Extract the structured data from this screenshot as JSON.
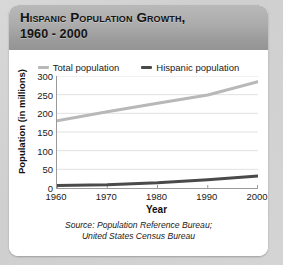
{
  "card": {
    "title_main": "Hispanic Population Growth,",
    "title_sub": "1960 - 2000"
  },
  "source": {
    "line1": "Source: Population Reference Bureau;",
    "line2": "United States Census Bureau"
  },
  "colors": {
    "total_line": "#b8b8b8",
    "hispanic_line": "#4a4a4a",
    "axis": "#9a9a9a",
    "grid": "#e2e2e2",
    "card_bg": "#ffffff",
    "page_bg": "#d4d4d4",
    "titlebar_top": "#b9b9b9",
    "titlebar_bottom": "#949494",
    "text": "#111111"
  },
  "chart_data": {
    "type": "line",
    "title": "Hispanic Population Growth, 1960 - 2000",
    "xlabel": "Year",
    "ylabel": "Population (in millions)",
    "x": [
      1960,
      1970,
      1980,
      1990,
      2000
    ],
    "xticklabels": [
      "1960",
      "1970",
      "1980",
      "1990",
      "2000"
    ],
    "xlim": [
      1960,
      2000
    ],
    "ylim": [
      0,
      300
    ],
    "yticks": [
      0,
      50,
      100,
      150,
      200,
      250,
      300
    ],
    "yticklabels": [
      "0",
      "50",
      "100",
      "150",
      "200",
      "250",
      "300"
    ],
    "grid": true,
    "legend_position": "top-center",
    "series": [
      {
        "name": "Total population",
        "color": "#b8b8b8",
        "values": [
          180,
          204,
          227,
          249,
          285
        ]
      },
      {
        "name": "Hispanic population",
        "color": "#4a4a4a",
        "values": [
          7,
          9,
          14,
          22,
          32
        ]
      }
    ]
  }
}
